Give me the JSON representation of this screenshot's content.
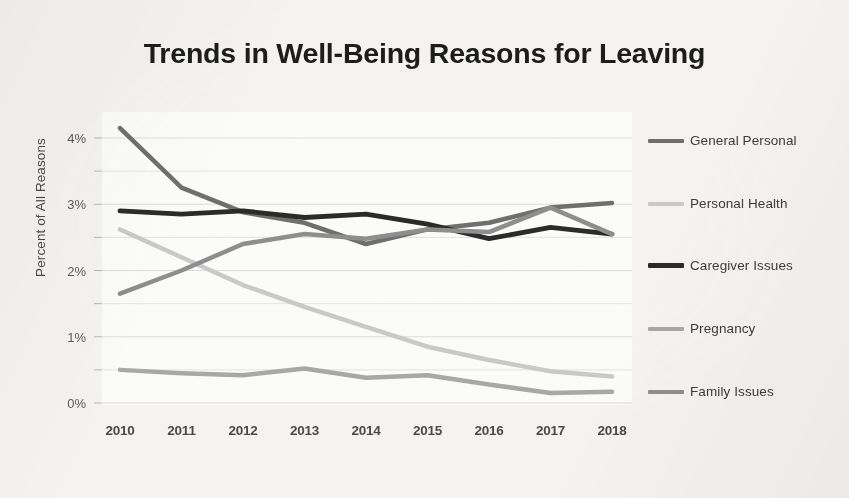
{
  "chart_data": {
    "type": "line",
    "title": "Trends in Well-Being Reasons for Leaving",
    "xlabel": "",
    "ylabel": "Percent of All Reasons",
    "categories": [
      "2010",
      "2011",
      "2012",
      "2013",
      "2014",
      "2015",
      "2016",
      "2017",
      "2018"
    ],
    "x": [
      2010,
      2011,
      2012,
      2013,
      2014,
      2015,
      2016,
      2017,
      2018
    ],
    "ylim": [
      0,
      4.5
    ],
    "y_ticks": [
      0,
      1,
      2,
      3,
      4
    ],
    "y_tick_labels": [
      "0%",
      "1%",
      "2%",
      "3%",
      "4%"
    ],
    "y_minor_ticks": [
      0.5,
      1.5,
      2.5,
      3.5
    ],
    "grid": "horizontal",
    "legend_position": "right",
    "series": [
      {
        "name": "General Personal",
        "color": "#6f6f6f",
        "width": 4.5,
        "values": [
          4.15,
          3.25,
          2.88,
          2.72,
          2.4,
          2.62,
          2.72,
          2.95,
          3.02
        ]
      },
      {
        "name": "Personal Health",
        "color": "#c9c9c9",
        "width": 4.5,
        "values": [
          2.62,
          2.2,
          1.78,
          1.45,
          1.15,
          0.85,
          0.65,
          0.48,
          0.4
        ]
      },
      {
        "name": "Caregiver Issues",
        "color": "#2b2b2b",
        "width": 4.8,
        "values": [
          2.9,
          2.85,
          2.9,
          2.8,
          2.85,
          2.7,
          2.48,
          2.65,
          2.55
        ]
      },
      {
        "name": "Pregnancy",
        "color": "#a8a8a8",
        "width": 4.5,
        "values": [
          0.5,
          0.45,
          0.42,
          0.52,
          0.38,
          0.42,
          0.28,
          0.15,
          0.17
        ]
      },
      {
        "name": "Family Issues",
        "color": "#8e8e8e",
        "width": 4.5,
        "values": [
          1.65,
          2.0,
          2.4,
          2.55,
          2.48,
          2.62,
          2.58,
          2.95,
          2.55
        ]
      }
    ]
  },
  "legend": {
    "items": [
      {
        "label": "General Personal",
        "color": "#6f6f6f",
        "y": 133
      },
      {
        "label": "Personal Health",
        "color": "#c9c9c9",
        "y": 196
      },
      {
        "label": "Caregiver Issues",
        "color": "#2b2b2b",
        "y": 258
      },
      {
        "label": "Pregnancy",
        "color": "#a8a8a8",
        "y": 321
      },
      {
        "label": "Family Issues",
        "color": "#8e8e8e",
        "y": 384
      }
    ]
  },
  "axes": {
    "grid_color": "#d8d8d8",
    "text_color": "#4a4a4a"
  }
}
